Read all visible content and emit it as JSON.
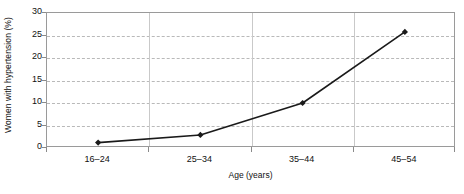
{
  "chart_data": {
    "type": "line",
    "title": "",
    "xlabel": "Age (years)",
    "ylabel": "Women with hypertension (%)",
    "categories": [
      "16–24",
      "25–34",
      "35–44",
      "45–54"
    ],
    "values": [
      1.2,
      2.9,
      10.0,
      25.8
    ],
    "series": [
      {
        "name": "Women with hypertension",
        "values": [
          1.2,
          2.9,
          10.0,
          25.8
        ]
      }
    ],
    "ylim": [
      0,
      30
    ],
    "y_ticks": [
      0,
      5,
      10,
      15,
      20,
      25,
      30
    ],
    "y_tick_labels": [
      "0",
      "5",
      "10",
      "15",
      "20",
      "25",
      "30"
    ],
    "grid": "horizontal-dashed",
    "legend": "none",
    "marker": "filled-diamond",
    "line_color": "#1a1a1a",
    "grid_color": "#b9b9b9",
    "frame_color": "#9a9a9a",
    "text_color": "#111111"
  },
  "axes": {
    "y_title": "Women with hypertension (%)",
    "x_title": "Age (years)"
  }
}
